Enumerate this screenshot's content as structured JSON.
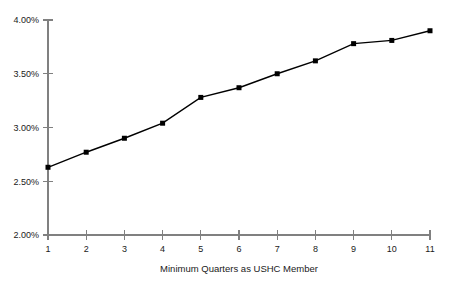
{
  "chart_data": {
    "type": "line",
    "title": "",
    "subtitle": "",
    "xlabel": "Minimum Quarters as USHC Member",
    "ylabel": "",
    "x": [
      1,
      2,
      3,
      4,
      5,
      6,
      7,
      8,
      9,
      10,
      11
    ],
    "categories": [
      "1",
      "2",
      "3",
      "4",
      "5",
      "6",
      "7",
      "8",
      "9",
      "10",
      "11"
    ],
    "values": [
      2.63,
      2.77,
      2.9,
      3.04,
      3.28,
      3.37,
      3.5,
      3.62,
      3.78,
      3.81,
      3.9
    ],
    "series": [
      {
        "name": "",
        "values": [
          2.63,
          2.77,
          2.9,
          3.04,
          3.28,
          3.37,
          3.5,
          3.62,
          3.78,
          3.81,
          3.9
        ]
      }
    ],
    "value_format": "percent",
    "ylim": [
      2.0,
      4.0
    ],
    "ytick_step": 0.5,
    "ytick_labels": [
      "2.00%",
      "2.50%",
      "3.00%",
      "3.50%",
      "4.00%"
    ],
    "ytick_values": [
      2.0,
      2.5,
      3.0,
      3.5,
      4.0
    ],
    "xtick_labels": [
      "1",
      "2",
      "3",
      "4",
      "5",
      "6",
      "7",
      "8",
      "9",
      "10",
      "11"
    ],
    "xlim": [
      1,
      11
    ],
    "grid": false,
    "legend": false,
    "legend_position": "none",
    "marker": "square",
    "colors": {
      "line": "#000000",
      "marker": "#000000",
      "axis": "#808080",
      "text": "#1a1a1a",
      "background": "#ffffff"
    },
    "annotations": []
  },
  "geometry": {
    "plot_left": 48,
    "plot_right": 430,
    "plot_top": 20,
    "plot_bottom": 235,
    "tick_length": 5,
    "marker_size": 5
  }
}
